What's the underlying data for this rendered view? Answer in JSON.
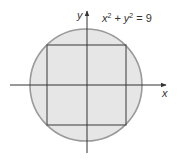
{
  "diagram": {
    "type": "inscribed-square-in-circle",
    "equation": {
      "base_x": "x",
      "exp_x": "2",
      "plus": "+",
      "base_y": "y",
      "exp_y": "2",
      "equals": "=",
      "rhs": "9"
    },
    "axes": {
      "x_label": "x",
      "y_label": "y"
    },
    "circle": {
      "center": [
        86,
        85
      ],
      "radius": 56,
      "fill": "#e6e6e6",
      "stroke": "#9a9a9a"
    },
    "square": {
      "left": 47,
      "top": 45,
      "right": 126,
      "bottom": 125,
      "stroke": "#555555"
    },
    "axis_color": "#333333"
  }
}
